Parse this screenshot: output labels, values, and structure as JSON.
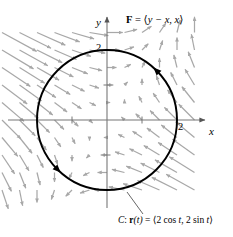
{
  "figure": {
    "axes": {
      "x_label": "x",
      "y_label": "y",
      "x_tick_label": "2",
      "y_tick_label": "2",
      "x_ticks": [
        -2,
        -1,
        1,
        2
      ],
      "y_ticks": [
        -2,
        -1,
        1,
        2
      ],
      "origin": [
        107,
        120
      ],
      "unit_px": 35
    },
    "field_label": {
      "bold_symbol": "F",
      "equals": " = ",
      "open_angle": "⟨",
      "component_1": "y − x",
      "comma": ", ",
      "component_2": "x",
      "close_angle": "⟩"
    },
    "caption": {
      "curve_name": "C",
      "colon": ": ",
      "bold_symbol": "r",
      "arg": "(t)",
      "equals": " = ",
      "open_angle": "⟨",
      "component_1_pre": "2 cos ",
      "component_1_var": "t",
      "comma": ", ",
      "component_2_pre": "2 sin ",
      "component_2_var": "t",
      "close_angle": "⟩"
    },
    "colors": {
      "curve": "#000000",
      "axis": "#6b6b6b",
      "vector_field": "#a8a8a8",
      "background": "#ffffff"
    }
  },
  "chart_data": {
    "type": "scatter",
    "title": "",
    "xlabel": "x",
    "ylabel": "y",
    "xlim": [
      -3.0,
      2.85
    ],
    "ylim": [
      -2.1,
      3.0
    ],
    "grid": false,
    "legend": "none",
    "annotations": [
      "F = ⟨y − x, x⟩",
      "C: r(t) = ⟨2 cos t, 2 sin t⟩"
    ],
    "vector_field": {
      "formula": "F(x,y) = (y - x, x)",
      "u_expression": "y - x",
      "v_expression": "x",
      "sample_x": [
        -3.0,
        -2.5,
        -2.0,
        -1.5,
        -1.0,
        -0.5,
        0.0,
        0.5,
        1.0,
        1.5,
        2.0,
        2.5
      ],
      "sample_y": [
        -2.0,
        -1.5,
        -1.0,
        -0.5,
        0.0,
        0.5,
        1.0,
        1.5,
        2.0,
        2.5
      ],
      "arrow_color": "#a8a8a8",
      "scale": 0.18
    },
    "curve": {
      "name": "C",
      "parametrization": "r(t) = (2 cos t, 2 sin t)",
      "x_expression": "2 cos t",
      "y_expression": "2 sin t",
      "t_range": [
        0,
        6.283185307179586
      ],
      "shape": "circle",
      "center": [
        0,
        0
      ],
      "radius": 2,
      "orientation": "counterclockwise",
      "color": "#000000",
      "direction_markers_t": [
        0.7853981633974483,
        3.9269908169872414
      ]
    }
  }
}
